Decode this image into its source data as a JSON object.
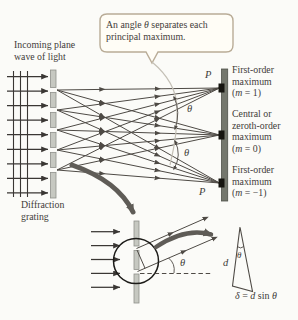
{
  "callout": {
    "pre": "An angle ",
    "theta": "θ",
    "post": " separates each",
    "line2": "principal maximum."
  },
  "labels": {
    "incoming_line1": "Incoming plane",
    "incoming_line2": "wave of light",
    "grating_line1": "Diffraction",
    "grating_line2": "grating",
    "p_top": "P",
    "p_bottom": "P",
    "theta_upper": "θ",
    "theta_lower": "θ",
    "theta_inset": "θ",
    "theta_triangle": "θ",
    "d": "d"
  },
  "maxima": [
    {
      "line1": "First-order",
      "line2": "maximum",
      "order_pre": "(",
      "order_var": "m",
      "order_post": " = 1)"
    },
    {
      "line1": "Central or",
      "line2": "zeroth-order",
      "line3": "maximum",
      "order_pre": "(",
      "order_var": "m",
      "order_post": " = 0)"
    },
    {
      "line1": "First-order",
      "line2": "maximum",
      "order_pre": "(",
      "order_var": "m",
      "order_post": " = −1)"
    }
  ],
  "formula": {
    "delta": "δ",
    "eq": " = ",
    "d": "d",
    "sin": " sin ",
    "theta": "θ"
  },
  "colors": {
    "background": "#fbfbf8",
    "text": "#3f3c38",
    "ray": "#4e4a45",
    "arrow_dark": "#3a3734",
    "grating_fill": "#c6c8c1",
    "grating_edge": "#8f918a",
    "screen_fill": "#74776d",
    "screen_edge": "#4f524a",
    "mark": "#15140f",
    "callout_fill": "#fffdf6",
    "callout_border": "#b9ac97",
    "leader": "#c4c0b6",
    "swoosh": "#5f5c57"
  }
}
